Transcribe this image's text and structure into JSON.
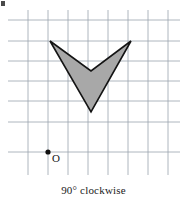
{
  "figure": {
    "kind": "coordinate-grid-rotation-figure",
    "width": 187,
    "height": 199,
    "background_color": "#ffffff",
    "caption": "90° clockwise",
    "origin_label": "O",
    "corner_artifact": true
  },
  "grid": {
    "line_color": "#9aa3ad",
    "line_width": 0.8,
    "spacing_px": 20,
    "vertical_lines_x": [
      28,
      48,
      68,
      88,
      108,
      128,
      148,
      168
    ],
    "vertical_line_top": 10,
    "vertical_line_bottom": 175,
    "horizontal_lines_y": [
      20,
      41,
      61,
      81,
      101,
      122,
      152
    ],
    "horizontal_line_left": 8,
    "horizontal_line_right": 180
  },
  "origin_point": {
    "x": 48,
    "y": 152,
    "radius": 2.6,
    "color": "#101010",
    "label": "O",
    "label_x": 52,
    "label_y": 153
  },
  "shape": {
    "name": "chevron-arrow",
    "fill_color": "#a8a8a8",
    "stroke_color": "#141414",
    "stroke_width": 1.6,
    "vertices": [
      {
        "name": "left-tip",
        "x": 50,
        "y": 41
      },
      {
        "name": "inner-notch",
        "x": 91,
        "y": 71
      },
      {
        "name": "right-tip",
        "x": 131,
        "y": 41
      },
      {
        "name": "bottom-tip",
        "x": 91,
        "y": 112
      }
    ],
    "points_attr": "50,41 91,71 131,41 91,112"
  }
}
